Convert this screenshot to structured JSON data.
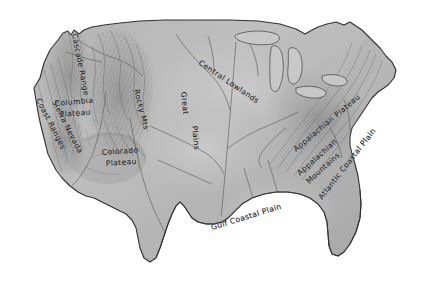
{
  "map": {
    "title": "Physiographic Regions of the United States",
    "style": "grayscale shaded-relief pencil map",
    "background_color": "#ffffff",
    "land_fill_color": "#a9a9a9",
    "land_fill_light": "#c3c3c3",
    "coastline_color": "#3a3a3a",
    "label_color": "#141414",
    "river_color": "#5a5a5a",
    "width": 427,
    "height": 284,
    "labels": [
      {
        "id": "cascade-range",
        "text": "Cascade Range",
        "orientation": "vertical-curved",
        "x": 74,
        "y": 38,
        "rotation": 80,
        "font_size": 7.4
      },
      {
        "id": "columbia-plateau",
        "text": "Columbia",
        "text2": "Plateau",
        "orientation": "horizontal",
        "x": 57,
        "y": 104,
        "rotation": -6,
        "font_size": 8.2
      },
      {
        "id": "coast-ranges",
        "text": "Coast Ranges",
        "orientation": "diagonal",
        "x": 40,
        "y": 100,
        "rotation": 62,
        "font_size": 7.2
      },
      {
        "id": "sierra-nevada",
        "text": "Sierra Nevada",
        "orientation": "diagonal",
        "x": 55,
        "y": 103,
        "rotation": 62,
        "font_size": 7.2
      },
      {
        "id": "colorado-plateau",
        "text": "Colorado",
        "text2": "Plateau",
        "orientation": "horizontal",
        "x": 106,
        "y": 152,
        "rotation": -4,
        "font_size": 8.2
      },
      {
        "id": "rocky-mountains",
        "text": "Rocky Mts",
        "orientation": "vertical",
        "x": 136,
        "y": 92,
        "rotation": 76,
        "font_size": 7.8
      },
      {
        "id": "great-plains",
        "text": "Great",
        "text2": "Plains",
        "orientation": "vertical",
        "x": 184,
        "y": 96,
        "rotation": 84,
        "font_size": 8.4
      },
      {
        "id": "central-lowlands",
        "text": "Central  Lowlands",
        "orientation": "diagonal",
        "x": 200,
        "y": 66,
        "rotation": 33,
        "font_size": 8.2
      },
      {
        "id": "appalachian-plateau",
        "text": "Appalachian Plateau",
        "orientation": "diagonal",
        "x": 298,
        "y": 150,
        "rotation": -40,
        "font_size": 7.6
      },
      {
        "id": "appalachian-mountains",
        "text": "Appalachian",
        "text2": "Mountains",
        "orientation": "diagonal",
        "x": 300,
        "y": 172,
        "rotation": -42,
        "font_size": 7.4
      },
      {
        "id": "atlantic-coastal-plain",
        "text": "Atlantic Coastal Plain",
        "orientation": "diagonal",
        "x": 327,
        "y": 196,
        "rotation": -52,
        "font_size": 7.4
      },
      {
        "id": "gulf-coastal-plain",
        "text": "Gulf Coastal Plain",
        "orientation": "arc",
        "x": 216,
        "y": 228,
        "rotation": -16,
        "font_size": 8.4
      }
    ]
  }
}
